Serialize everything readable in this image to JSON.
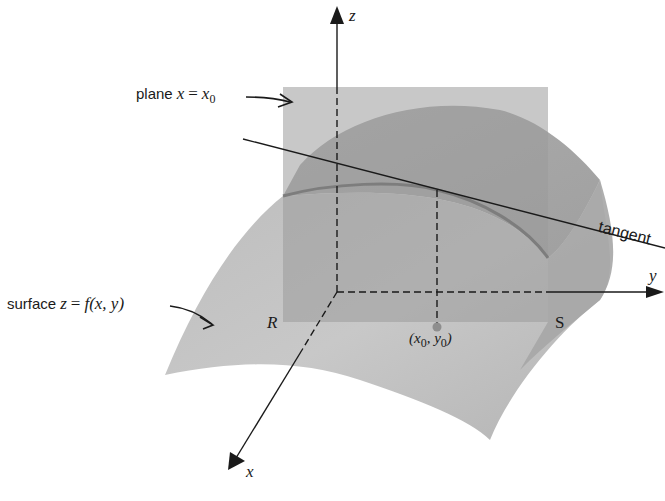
{
  "diagram": {
    "axes": {
      "z_label": "z",
      "y_label": "y",
      "x_label": "x"
    },
    "labels": {
      "plane": {
        "text": "plane",
        "var": "x",
        "eq": "=",
        "rhs_var": "x",
        "rhs_sub": "0"
      },
      "surface": {
        "text": "surface",
        "var": "z",
        "eq": "=",
        "func": "f(x, y)"
      },
      "tangent": "tangent",
      "region_left": "R",
      "region_right": "S",
      "point": {
        "open": "(",
        "x": "x",
        "x_sub": "0",
        "sep": ", ",
        "y": "y",
        "y_sub": "0",
        "close": ")"
      }
    },
    "colors": {
      "plane_fill": "#a9a9a9",
      "surface_light": "#c4c4c4",
      "surface_dark": "#9a9a9a",
      "curve": "#8a8a8a",
      "point": "#8e8e8e",
      "ink": "#1a1a1a"
    }
  }
}
